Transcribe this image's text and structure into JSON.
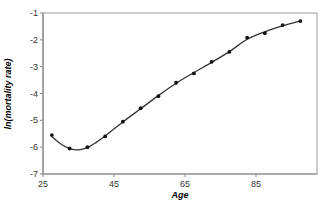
{
  "chart_data": {
    "type": "line",
    "title": "",
    "xlabel": "Age",
    "ylabel": "ln(mortality rate)",
    "xlim": [
      25,
      101
    ],
    "ylim": [
      -7,
      -1
    ],
    "x_ticks": [
      25,
      45,
      65,
      85
    ],
    "y_ticks": [
      -7,
      -6,
      -5,
      -4,
      -3,
      -2,
      -1
    ],
    "grid": false,
    "legend": null,
    "series": [
      {
        "name": "observed",
        "style": "markers",
        "x": [
          27.5,
          32.5,
          37.5,
          42.5,
          47.5,
          52.5,
          57.5,
          62.5,
          67.5,
          72.5,
          77.5,
          82.5,
          87.5,
          92.5,
          97.5
        ],
        "values": [
          -5.55,
          -6.05,
          -6.0,
          -5.6,
          -5.05,
          -4.55,
          -4.1,
          -3.6,
          -3.25,
          -2.82,
          -2.45,
          -1.92,
          -1.75,
          -1.45,
          -1.3
        ]
      },
      {
        "name": "fitted",
        "style": "smooth-line",
        "x": [
          27.5,
          30,
          32.5,
          35,
          37.5,
          40,
          42.5,
          47.5,
          52.5,
          57.5,
          62.5,
          67.5,
          72.5,
          77.5,
          82.5,
          87.5,
          92.5,
          97.5
        ],
        "values": [
          -5.6,
          -5.88,
          -6.05,
          -6.1,
          -6.02,
          -5.82,
          -5.58,
          -5.06,
          -4.57,
          -4.08,
          -3.62,
          -3.22,
          -2.84,
          -2.44,
          -1.98,
          -1.7,
          -1.48,
          -1.3
        ]
      }
    ]
  },
  "colors": {
    "line": "#333333",
    "marker": "#111111",
    "axis": "#888888",
    "frame": "#999999"
  }
}
